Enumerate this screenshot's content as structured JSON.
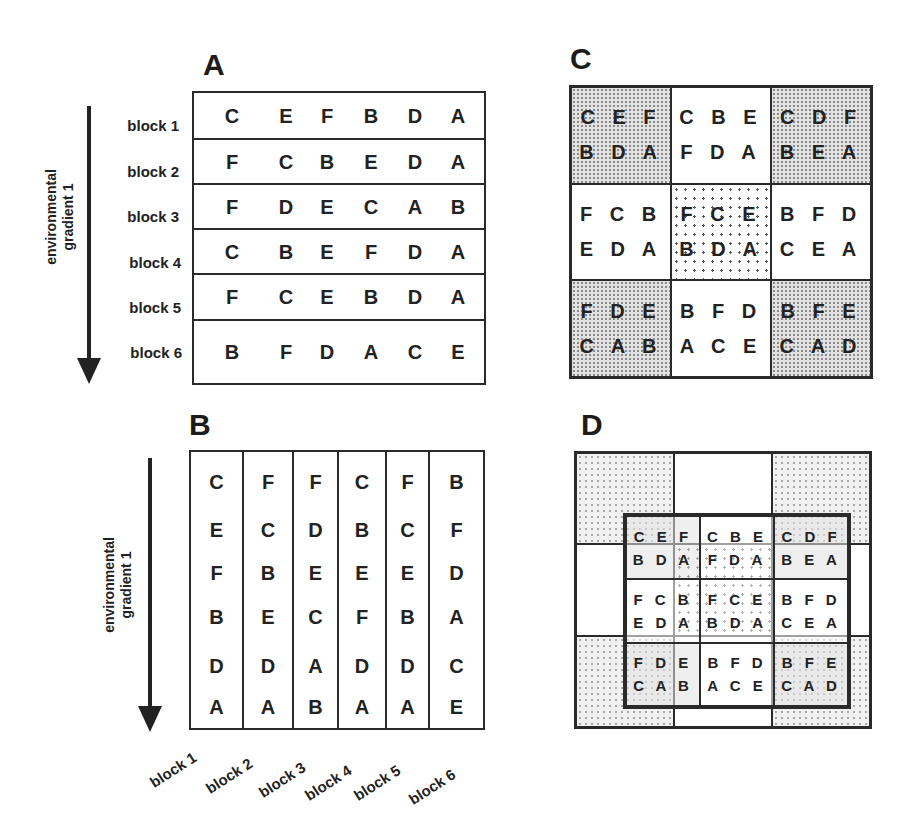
{
  "figure": {
    "panels": {
      "A": {
        "label": "A",
        "design": "randomized complete blocks (blocks perpendicular to gradient)",
        "axis_label_line1": "environmental",
        "axis_label_line2": "gradient 1",
        "blocks": [
          {
            "label": "block 1",
            "plots": [
              "C",
              "E",
              "F",
              "B",
              "D",
              "A"
            ]
          },
          {
            "label": "block 2",
            "plots": [
              "F",
              "C",
              "B",
              "E",
              "D",
              "A"
            ]
          },
          {
            "label": "block 3",
            "plots": [
              "F",
              "D",
              "E",
              "C",
              "A",
              "B"
            ]
          },
          {
            "label": "block 4",
            "plots": [
              "C",
              "B",
              "E",
              "F",
              "D",
              "A"
            ]
          },
          {
            "label": "block 5",
            "plots": [
              "F",
              "C",
              "E",
              "B",
              "D",
              "A"
            ]
          },
          {
            "label": "block 6",
            "plots": [
              "B",
              "F",
              "D",
              "A",
              "C",
              "E"
            ]
          }
        ]
      },
      "B": {
        "label": "B",
        "design": "blocks parallel to gradient",
        "axis_label_line1": "environmental",
        "axis_label_line2": "gradient 1",
        "blocks": [
          {
            "label": "block 1",
            "plots": [
              "C",
              "E",
              "F",
              "B",
              "D",
              "A"
            ]
          },
          {
            "label": "block 2",
            "plots": [
              "F",
              "C",
              "B",
              "E",
              "D",
              "A"
            ]
          },
          {
            "label": "block 3",
            "plots": [
              "F",
              "D",
              "E",
              "C",
              "A",
              "B"
            ]
          },
          {
            "label": "block 4",
            "plots": [
              "C",
              "B",
              "E",
              "F",
              "D",
              "A"
            ]
          },
          {
            "label": "block 5",
            "plots": [
              "F",
              "C",
              "E",
              "B",
              "D",
              "A"
            ]
          },
          {
            "label": "block 6",
            "plots": [
              "B",
              "F",
              "D",
              "A",
              "C",
              "E"
            ]
          }
        ]
      },
      "C": {
        "label": "C",
        "blocks": [
          {
            "top": "C E F",
            "bottom": "B D A",
            "shade": "dense"
          },
          {
            "top": "C B E",
            "bottom": "F D A",
            "shade": "plain"
          },
          {
            "top": "C D F",
            "bottom": "B E A",
            "shade": "dense"
          },
          {
            "top": "F C B",
            "bottom": "E D A",
            "shade": "plain"
          },
          {
            "top": "F C E",
            "bottom": "B D A",
            "shade": "triangles"
          },
          {
            "top": "B F D",
            "bottom": "C E A",
            "shade": "plain"
          },
          {
            "top": "F D E",
            "bottom": "C A B",
            "shade": "dense"
          },
          {
            "top": "B F D",
            "bottom": "A C E",
            "shade": "plain"
          },
          {
            "top": "B F E",
            "bottom": "C A D",
            "shade": "dense"
          }
        ]
      },
      "D": {
        "label": "D",
        "environment_cells": [
          {
            "shade": "light"
          },
          {
            "shade": "plain"
          },
          {
            "shade": "light"
          },
          {
            "shade": "plain"
          },
          {
            "shade": "triangles"
          },
          {
            "shade": "plain"
          },
          {
            "shade": "light"
          },
          {
            "shade": "plain"
          },
          {
            "shade": "light"
          }
        ],
        "blocks": [
          {
            "top": "C E F",
            "bottom": "B D A"
          },
          {
            "top": "C B E",
            "bottom": "F D A"
          },
          {
            "top": "C D F",
            "bottom": "B E A"
          },
          {
            "top": "F C B",
            "bottom": "E D A"
          },
          {
            "top": "F C E",
            "bottom": "B D A"
          },
          {
            "top": "B F D",
            "bottom": "C E A"
          },
          {
            "top": "F D E",
            "bottom": "C A B"
          },
          {
            "top": "B F D",
            "bottom": "A C E"
          },
          {
            "top": "B F E",
            "bottom": "C A D"
          }
        ]
      }
    }
  }
}
